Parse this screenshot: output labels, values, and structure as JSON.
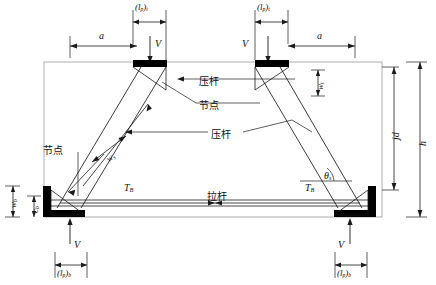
{
  "figure": {
    "type": "strut-and-tie-model",
    "title": "",
    "background": "#ffffff",
    "line_color": "#1a1a1a",
    "plate_color": "#000000",
    "width": 436,
    "height": 285
  },
  "labels": {
    "lp_top_left": "(l",
    "lp_top_left_sub": "p",
    "lp_top_left_suffix": ")",
    "lp_top_left_sub2": "t",
    "a_left": "a",
    "a_right": "a",
    "V_top_left": "V",
    "V_top_right": "V",
    "V_bottom_left": "V",
    "V_bottom_right": "V",
    "T_B_left": "T",
    "T_B_left_sub": "B",
    "T_B_right": "T",
    "T_B_right_sub": "B",
    "theta_s": "θ",
    "theta_s_sub": "s",
    "w_top": "w",
    "w_top_sub": "t",
    "w_s": "w",
    "w_s_sub": "s",
    "w_b": "w",
    "w_b_sub": "b",
    "c_b": "c",
    "c_b_sub": "b",
    "h": "h",
    "jd": "jd",
    "strut_top": "压杆",
    "node_top": "节点",
    "strut_mid": "压杆",
    "tie": "拉杆",
    "node_left": "节点"
  },
  "dimensions": {
    "lp_t_top_left": "(lp)t",
    "lp_t_top_right": "(lp)t",
    "lp_b_bottom_left": "(lp)b",
    "lp_b_bottom_right": "(lp)b",
    "span_a": "a",
    "height_h": "h",
    "height_jd": "jd"
  },
  "annotations": [
    {
      "name": "compression-strut-top",
      "text": "压杆",
      "kind": "leader-label"
    },
    {
      "name": "node-top",
      "text": "节点",
      "kind": "leader-label"
    },
    {
      "name": "compression-strut-middle",
      "text": "压杆",
      "kind": "leader-label"
    },
    {
      "name": "tension-tie",
      "text": "拉杆",
      "kind": "leader-label"
    },
    {
      "name": "node-left",
      "text": "节点",
      "kind": "leader-label"
    }
  ],
  "forces": [
    {
      "name": "shear-top-left",
      "symbol": "V",
      "direction": "down"
    },
    {
      "name": "shear-top-right",
      "symbol": "V",
      "direction": "down"
    },
    {
      "name": "shear-bottom-left",
      "symbol": "V",
      "direction": "up"
    },
    {
      "name": "shear-bottom-right",
      "symbol": "V",
      "direction": "up"
    },
    {
      "name": "tie-force-left",
      "symbol": "TB",
      "direction": "right"
    },
    {
      "name": "tie-force-right",
      "symbol": "TB",
      "direction": "left"
    }
  ]
}
